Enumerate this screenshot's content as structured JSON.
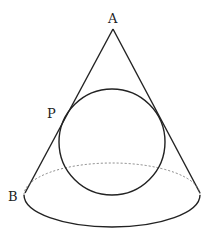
{
  "diagram": {
    "labels": {
      "apex": "A",
      "tangent_point": "P",
      "base_point": "B"
    },
    "colors": {
      "stroke": "#222222",
      "dashed": "#777777",
      "background": "#ffffff"
    }
  }
}
